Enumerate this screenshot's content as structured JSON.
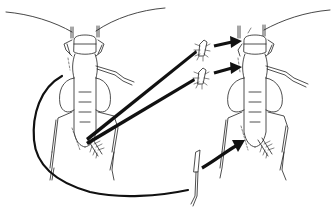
{
  "figure": {
    "colors": {
      "background": "#ffffff",
      "line": "#222222",
      "arrow": "#111111"
    },
    "panels": [
      {
        "id": "donor",
        "label": ""
      },
      {
        "id": "host",
        "label": ""
      }
    ],
    "transplants": [
      {
        "from": "donor-cercus",
        "to": "host-head-left",
        "part": "cercus-fragment"
      },
      {
        "from": "donor-cercus",
        "to": "host-thorax-left",
        "part": "cercus-fragment"
      },
      {
        "from": "donor-hind-leg",
        "to": "host-abdomen-tip",
        "part": "leg-segment"
      }
    ],
    "text_labels": []
  }
}
